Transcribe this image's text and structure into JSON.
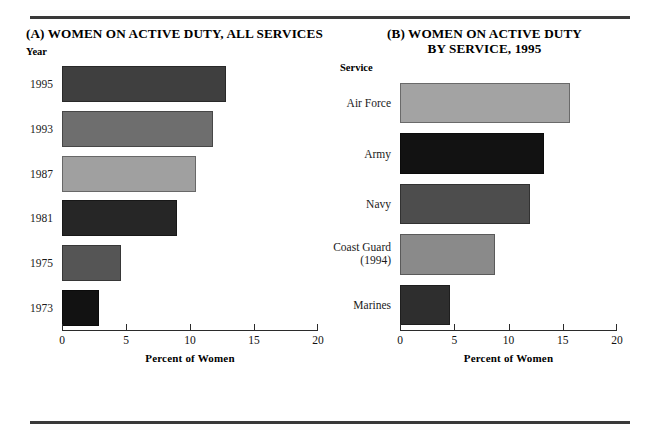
{
  "figure": {
    "background": "#ffffff",
    "rule_color": "#3a3a3a"
  },
  "panel_a": {
    "title": "(A) WOMEN ON ACTIVE DUTY, ALL SERVICES",
    "category_axis_name": "Year",
    "value_axis_title": "Percent of Women"
  },
  "panel_b": {
    "title_line1": "(B)  WOMEN ON ACTIVE DUTY",
    "title_line2": "BY SERVICE, 1995",
    "category_axis_name": "Service",
    "value_axis_title": "Percent of Women"
  },
  "chart_data": [
    {
      "type": "bar",
      "orientation": "horizontal",
      "title": "(A) WOMEN ON ACTIVE DUTY, ALL SERVICES",
      "xlabel": "Percent of Women",
      "ylabel": "Year",
      "xlim": [
        0,
        20
      ],
      "xticks": [
        "0",
        "5",
        "10",
        "15",
        "20"
      ],
      "grid": false,
      "legend": "none",
      "categories": [
        "1995",
        "1993",
        "1987",
        "1981",
        "1975",
        "1973"
      ],
      "values": [
        12.8,
        11.8,
        10.5,
        9.0,
        4.6,
        2.9
      ],
      "colors": [
        "#3f3f3f",
        "#6e6e6e",
        "#a0a0a0",
        "#262626",
        "#555555",
        "#121212"
      ]
    },
    {
      "type": "bar",
      "orientation": "horizontal",
      "title": "(B)  WOMEN ON ACTIVE DUTY BY SERVICE, 1995",
      "xlabel": "Percent of Women",
      "ylabel": "Service",
      "xlim": [
        0,
        20
      ],
      "xticks": [
        "0",
        "5",
        "10",
        "15",
        "20"
      ],
      "grid": false,
      "legend": "none",
      "categories": [
        "Air Force",
        "Army",
        "Navy",
        "Coast Guard (1994)",
        "Marines"
      ],
      "category_labels": [
        {
          "main": "Air Force",
          "sub": ""
        },
        {
          "main": "Army",
          "sub": ""
        },
        {
          "main": "Navy",
          "sub": ""
        },
        {
          "main": "Coast Guard",
          "sub": "(1994)"
        },
        {
          "main": "Marines",
          "sub": ""
        }
      ],
      "values": [
        15.7,
        13.3,
        12.0,
        8.8,
        4.6
      ],
      "colors": [
        "#a3a3a3",
        "#121212",
        "#4d4d4d",
        "#8a8a8a",
        "#2e2e2e"
      ]
    }
  ]
}
